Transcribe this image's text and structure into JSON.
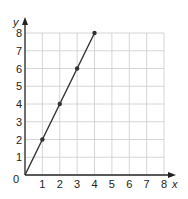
{
  "chart_data": {
    "type": "line",
    "title": "",
    "xlabel": "x",
    "ylabel": "y",
    "xlim": [
      0,
      8
    ],
    "ylim": [
      0,
      8
    ],
    "grid": true,
    "x_ticks": [
      "1",
      "2",
      "3",
      "4",
      "5",
      "6",
      "7",
      "8"
    ],
    "y_ticks": [
      "1",
      "2",
      "3",
      "4",
      "5",
      "6",
      "7",
      "8"
    ],
    "origin_label": "0",
    "series": [
      {
        "name": "y = 2x",
        "x": [
          0,
          1,
          2,
          3,
          4
        ],
        "y": [
          0,
          2,
          4,
          6,
          8
        ],
        "markers": [
          [
            1,
            2
          ],
          [
            2,
            4
          ],
          [
            3,
            6
          ],
          [
            4,
            8
          ]
        ]
      }
    ],
    "colors": {
      "line": "#333333",
      "grid": "#cccccc",
      "axis": "#222222"
    }
  }
}
